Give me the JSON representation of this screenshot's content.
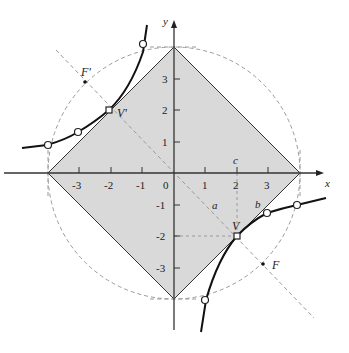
{
  "diagram": {
    "axes": {
      "x_label": "x",
      "y_label": "y",
      "x_ticks": [
        "-3",
        "-2",
        "-1",
        "0",
        "1",
        "2",
        "3"
      ],
      "y_ticks": [
        "3",
        "2",
        "1",
        "-1",
        "-2",
        "-3"
      ],
      "origin_label": "0"
    },
    "labels": {
      "vertex": "V",
      "vertex_prime": "V'",
      "focus": "F",
      "focus_prime": "F'",
      "a": "a",
      "b": "b",
      "c": "c"
    },
    "colors": {
      "diamond_fill": "#d9d9d9",
      "curve": "#111111",
      "dashed": "#9a9a9a",
      "axis": "#333333"
    },
    "geometry": {
      "hyperbola": "xy = -4",
      "diamond_vertices": [
        [
          4,
          0
        ],
        [
          0,
          4
        ],
        [
          -4,
          0
        ],
        [
          0,
          -4
        ]
      ],
      "circle_radius": 4,
      "V": [
        2,
        -2
      ],
      "V_prime": [
        -2,
        2
      ],
      "F": [
        2.83,
        -2.83
      ],
      "F_prime": [
        -2.83,
        2.83
      ],
      "marked_points": [
        [
          -1,
          4
        ],
        [
          -2,
          2
        ],
        [
          -3.07,
          1.3
        ],
        [
          -4,
          1
        ],
        [
          2,
          -2
        ],
        [
          3.07,
          -1.3
        ],
        [
          4,
          -1
        ],
        [
          1,
          -4
        ]
      ]
    }
  }
}
